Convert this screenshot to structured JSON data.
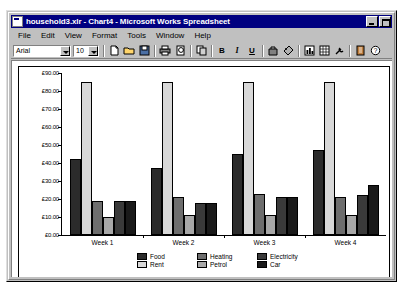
{
  "window": {
    "title": "household3.xlr - Chart4 - Microsoft Works Spreadsheet",
    "minimize_label": "Minimize",
    "maximize_label": "Maximize"
  },
  "menu": {
    "items": [
      {
        "label": "File"
      },
      {
        "label": "Edit"
      },
      {
        "label": "View"
      },
      {
        "label": "Format"
      },
      {
        "label": "Tools"
      },
      {
        "label": "Window"
      },
      {
        "label": "Help"
      }
    ]
  },
  "toolbar": {
    "font_name": "Arial",
    "font_size": "10",
    "buttons": [
      {
        "name": "new-icon",
        "glyph": "doc"
      },
      {
        "name": "open-icon",
        "glyph": "folder"
      },
      {
        "name": "save-icon",
        "glyph": "disk"
      },
      {
        "name": "print-icon",
        "glyph": "printer"
      },
      {
        "name": "print-preview-icon",
        "glyph": "preview"
      },
      {
        "name": "copy-icon",
        "glyph": "copy"
      },
      {
        "name": "bold-icon",
        "glyph": "B"
      },
      {
        "name": "italic-icon",
        "glyph": "I"
      },
      {
        "name": "underline-icon",
        "glyph": "U"
      },
      {
        "name": "chart-type-icon",
        "glyph": "bag"
      },
      {
        "name": "fill-color-icon",
        "glyph": "tag"
      },
      {
        "name": "insert-chart-icon",
        "glyph": "grid"
      },
      {
        "name": "spreadsheet-icon",
        "glyph": "sheet"
      },
      {
        "name": "tools-icon",
        "glyph": "wrench"
      },
      {
        "name": "address-book-icon",
        "glyph": "book"
      },
      {
        "name": "help-icon",
        "glyph": "?"
      }
    ]
  },
  "chart_data": {
    "type": "bar",
    "title": "",
    "xlabel": "",
    "ylabel": "",
    "categories": [
      "Week 1",
      "Week 2",
      "Week 3",
      "Week 4"
    ],
    "ylim": [
      0,
      90
    ],
    "ytick_labels": [
      "£90.00",
      "£80.00",
      "£70.00",
      "£60.00",
      "£50.00",
      "£40.00",
      "£30.00",
      "£20.00",
      "£10.00",
      "£0.00"
    ],
    "ytick_values": [
      90,
      80,
      70,
      60,
      50,
      40,
      30,
      20,
      10,
      0
    ],
    "grid": false,
    "legend_position": "bottom",
    "series": [
      {
        "name": "Food",
        "color": "#2b2b2b",
        "values": [
          42,
          37,
          45,
          47
        ]
      },
      {
        "name": "Rent",
        "color": "#d8d8d8",
        "values": [
          85,
          85,
          85,
          85
        ]
      },
      {
        "name": "Heating",
        "color": "#6e6e6e",
        "values": [
          19,
          21,
          23,
          21
        ]
      },
      {
        "name": "Petrol",
        "color": "#a8a8a8",
        "values": [
          10,
          11,
          11,
          11
        ]
      },
      {
        "name": "Electricity",
        "color": "#3a3a3a",
        "values": [
          19,
          18,
          21,
          22
        ]
      },
      {
        "name": "Car",
        "color": "#1a1a1a",
        "values": [
          19,
          18,
          21,
          28
        ]
      }
    ]
  }
}
